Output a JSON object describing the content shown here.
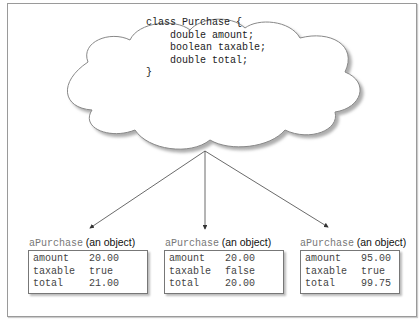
{
  "class_definition": {
    "lines": [
      "class Purchase {",
      "    double amount;",
      "    boolean taxable;",
      "    double total;",
      "}"
    ]
  },
  "objects": [
    {
      "name": "aPurchase",
      "label": "(an object)",
      "fields": [
        {
          "key": "amount",
          "value": "20.00"
        },
        {
          "key": "taxable",
          "value": "true"
        },
        {
          "key": "total",
          "value": "21.00"
        }
      ]
    },
    {
      "name": "aPurchase",
      "label": "(an object)",
      "fields": [
        {
          "key": "amount",
          "value": "20.00"
        },
        {
          "key": "taxable",
          "value": "false"
        },
        {
          "key": "total",
          "value": "20.00"
        }
      ]
    },
    {
      "name": "aPurchase",
      "label": "(an object)",
      "fields": [
        {
          "key": "amount",
          "value": "95.00"
        },
        {
          "key": "taxable",
          "value": "true"
        },
        {
          "key": "total",
          "value": "99.75"
        }
      ]
    }
  ]
}
